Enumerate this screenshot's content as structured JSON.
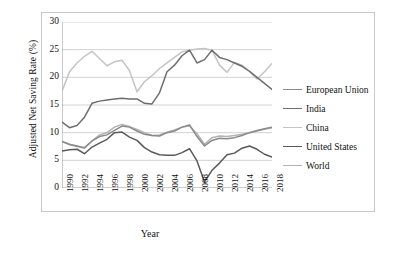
{
  "chart_data": {
    "type": "line",
    "title": "",
    "xlabel": "Year",
    "ylabel": "Adjusted Net Saving Rate (%)",
    "xlim": [
      1990,
      2018
    ],
    "ylim": [
      0,
      30
    ],
    "yticks": [
      0,
      5,
      10,
      15,
      20,
      25,
      30
    ],
    "grid": "horizontal",
    "legend_position": "right",
    "x": [
      1990,
      1991,
      1992,
      1993,
      1994,
      1995,
      1996,
      1997,
      1998,
      1999,
      2000,
      2001,
      2002,
      2003,
      2004,
      2005,
      2006,
      2007,
      2008,
      2009,
      2010,
      2011,
      2012,
      2013,
      2014,
      2015,
      2016,
      2017,
      2018
    ],
    "xtick_labels": [
      "1990",
      "1992",
      "1994",
      "1996",
      "1998",
      "2000",
      "2002",
      "2004",
      "2006",
      "2008",
      "2010",
      "2012",
      "2014",
      "2016",
      "2018"
    ],
    "series": [
      {
        "name": "European Union",
        "color": "#8a8a8a",
        "values": [
          8.4,
          7.9,
          7.6,
          7.3,
          8.5,
          9.3,
          9.6,
          10.4,
          11.2,
          11.0,
          10.3,
          9.7,
          9.5,
          9.4,
          10.0,
          10.3,
          11.0,
          11.4,
          9.3,
          7.6,
          8.6,
          9.0,
          8.9,
          9.1,
          9.5,
          10.0,
          10.4,
          10.7,
          11.0
        ]
      },
      {
        "name": "India",
        "color": "#6e6e6e",
        "values": [
          11.9,
          10.9,
          11.3,
          12.8,
          15.3,
          15.7,
          15.9,
          16.1,
          16.2,
          16.1,
          16.1,
          15.3,
          15.2,
          17.2,
          21.0,
          22.2,
          23.9,
          24.9,
          22.6,
          23.2,
          24.9,
          23.6,
          23.2,
          22.6,
          22.0,
          21.1,
          20.0,
          18.9,
          17.8
        ]
      },
      {
        "name": "China",
        "color": "#c4c4c4",
        "values": [
          17.5,
          21.0,
          22.6,
          23.8,
          24.7,
          23.4,
          22.1,
          22.8,
          23.1,
          21.2,
          17.4,
          19.2,
          20.3,
          21.6,
          22.6,
          23.6,
          24.6,
          24.9,
          25.1,
          25.2,
          24.9,
          22.2,
          20.9,
          22.7,
          22.2,
          21.0,
          19.7,
          21.0,
          22.5
        ]
      },
      {
        "name": "United States",
        "color": "#5a5a5a",
        "values": [
          6.7,
          6.9,
          7.0,
          6.2,
          7.4,
          8.1,
          8.8,
          10.0,
          10.1,
          9.2,
          8.6,
          7.3,
          6.5,
          6.0,
          5.9,
          5.9,
          6.4,
          7.1,
          4.9,
          1.1,
          3.2,
          4.5,
          6.0,
          6.3,
          7.2,
          7.6,
          7.0,
          6.1,
          5.6
        ]
      },
      {
        "name": "World",
        "color": "#b3b3b3",
        "values": [
          8.4,
          7.8,
          7.5,
          7.2,
          8.5,
          9.6,
          10.0,
          11.0,
          11.5,
          11.1,
          10.6,
          10.0,
          9.5,
          9.6,
          10.1,
          10.5,
          11.0,
          11.2,
          9.8,
          7.9,
          9.1,
          9.4,
          9.3,
          9.5,
          9.7,
          10.0,
          10.3,
          10.6,
          10.9
        ]
      }
    ]
  }
}
